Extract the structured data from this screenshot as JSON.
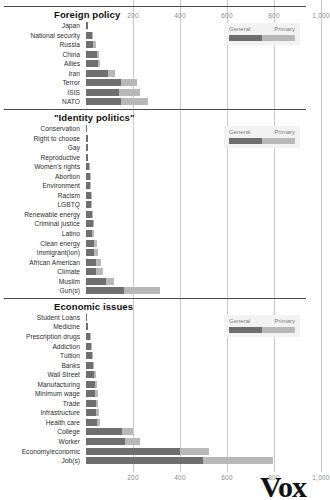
{
  "chart_data": {
    "type": "bar",
    "orientation": "horizontal",
    "stacked": true,
    "title": "",
    "xlabel": "",
    "ylabel": "",
    "xlim": [
      0,
      1060
    ],
    "grid": true,
    "ticks": [
      200,
      400,
      600,
      800,
      1000
    ],
    "tick_labels": [
      "200",
      "400",
      "600",
      "800",
      "1,000"
    ],
    "legend": {
      "position": "top-right",
      "entries": [
        "General",
        "Primary"
      ]
    },
    "series": [
      {
        "name": "General",
        "color": "#6f6f6f"
      },
      {
        "name": "Primary",
        "color": "#b8b8b8"
      }
    ],
    "sections": [
      {
        "title": "Foreign policy",
        "categories": [
          "Japan",
          "National security",
          "Russia",
          "China",
          "Allies",
          "Iran",
          "Terror",
          "ISIS",
          "NATO"
        ],
        "general": [
          8,
          26,
          30,
          46,
          50,
          92,
          150,
          142,
          150
        ],
        "primary": [
          0,
          4,
          12,
          10,
          10,
          32,
          65,
          88,
          112
        ]
      },
      {
        "title": "\"Identity politics\"",
        "categories": [
          "Conservation",
          "Right to choose",
          "Gay",
          "Reproductive",
          "Women's rights",
          "Abortion",
          "Environment",
          "Racism",
          "LGBTQ",
          "Renewable energy",
          "Criminal justice",
          "Latino",
          "Clean energy",
          "Immigrant(ion)",
          "African American",
          "Climate",
          "Muslim",
          "Gun(s)"
        ],
        "general": [
          4,
          8,
          8,
          10,
          14,
          16,
          16,
          20,
          22,
          24,
          30,
          26,
          34,
          32,
          42,
          44,
          86,
          162
        ],
        "primary": [
          0,
          0,
          0,
          0,
          2,
          2,
          4,
          4,
          4,
          4,
          4,
          10,
          14,
          20,
          22,
          28,
          34,
          152
        ]
      },
      {
        "title": "Economic issues",
        "categories": [
          "Student Loans",
          "Medicine",
          "Prescription drugs",
          "Addiction",
          "Tuition",
          "Banks",
          "Wall Street",
          "Manufacturing",
          "Minimum wage",
          "Trade",
          "Infrastructure",
          "Health care",
          "College",
          "Worker",
          "Economy/economic",
          "Job(s)"
        ],
        "general": [
          6,
          8,
          16,
          20,
          26,
          28,
          34,
          40,
          40,
          42,
          42,
          48,
          152,
          166,
          400,
          496
        ],
        "primary": [
          0,
          0,
          2,
          2,
          4,
          6,
          8,
          6,
          10,
          10,
          12,
          12,
          48,
          64,
          122,
          300
        ]
      }
    ]
  },
  "footer": {
    "logo": "Vox"
  }
}
